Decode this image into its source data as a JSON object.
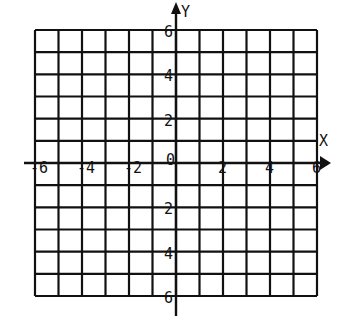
{
  "diagram": {
    "type": "coordinate-grid",
    "x_axis_label": "X",
    "y_axis_label": "Y",
    "x_range": [
      -6,
      6
    ],
    "y_range": [
      -6,
      6
    ],
    "grid_step": 1,
    "colors": {
      "line": "#111111",
      "background": "#ffffff"
    },
    "x_ticks": [
      {
        "value": -6,
        "label": "-6"
      },
      {
        "value": -4,
        "label": "-4"
      },
      {
        "value": -2,
        "label": "-2"
      },
      {
        "value": 0,
        "label": "0"
      },
      {
        "value": 2,
        "label": "2"
      },
      {
        "value": 4,
        "label": "4"
      },
      {
        "value": 6,
        "label": "6"
      }
    ],
    "y_ticks": [
      {
        "value": 6,
        "label": "6"
      },
      {
        "value": 4,
        "label": "4"
      },
      {
        "value": 2,
        "label": "2"
      },
      {
        "value": -2,
        "label": "2"
      },
      {
        "value": -4,
        "label": "4"
      },
      {
        "value": -6,
        "label": "6"
      }
    ]
  }
}
